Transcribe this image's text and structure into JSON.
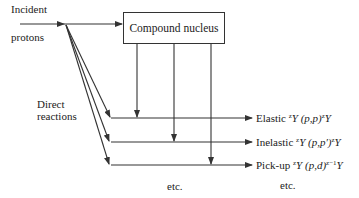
{
  "incident_label_line1": "Incident",
  "incident_label_line2": "protons",
  "compound_box_label": "Compound nucleus",
  "direct_label_line1": "Direct",
  "direct_label_line2": "reactions",
  "outcomes": [
    {
      "name": "Elastic",
      "sup_left": "z",
      "sym": "Y",
      "reaction": "(p,p)",
      "sup_right": "z",
      "product": "Y"
    },
    {
      "name": "Inelastic",
      "sup_left": "z",
      "sym": "Y",
      "reaction": "(p,p′)",
      "sup_right": "z",
      "product": "Y"
    },
    {
      "name": "Pick-up",
      "sup_left": "z",
      "sym": "Y",
      "reaction": "(p,d)",
      "sup_right": "z−1",
      "product": "Y"
    }
  ],
  "etc_left": "etc.",
  "etc_right": "etc.",
  "line_color": "#333333"
}
